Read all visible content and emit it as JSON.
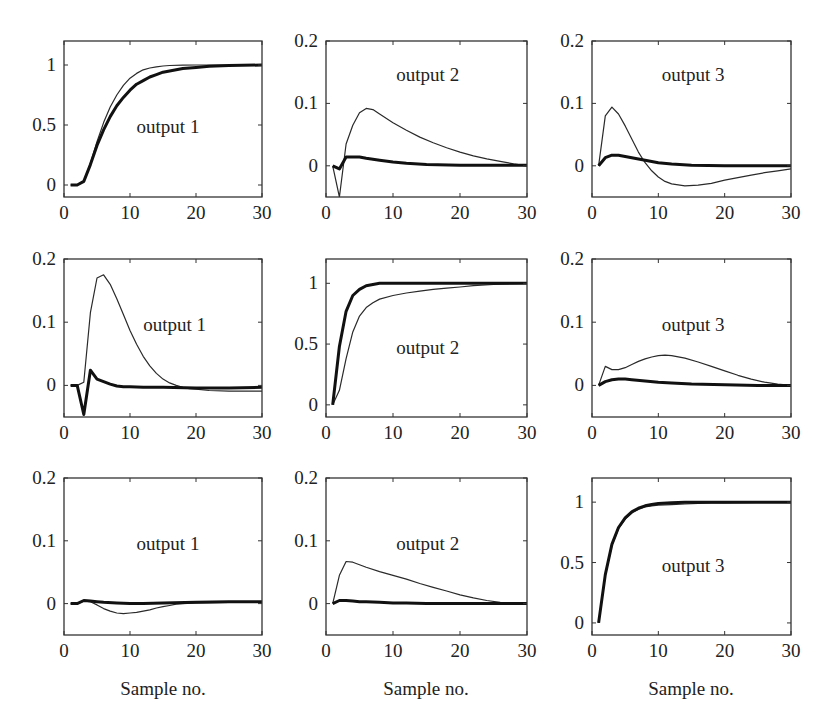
{
  "figure": {
    "xlabel": "Sample no.",
    "line_styles": {
      "thin": {
        "color": "#2a2a2a",
        "width": 1.2
      },
      "thick": {
        "color": "#111111",
        "width": 3
      }
    }
  },
  "chart_data": [
    {
      "type": "line",
      "row": 0,
      "col": 0,
      "title": "output 1",
      "xlabel": "",
      "ylabel": "",
      "xlim": [
        0,
        30
      ],
      "ylim": [
        -0.1,
        1.2
      ],
      "xticks": [
        0,
        10,
        20,
        30
      ],
      "yticks": [
        0,
        0.5,
        1
      ],
      "ytick_labels": [
        "0",
        "0.5",
        "1"
      ],
      "label_pos": [
        11,
        0.48
      ],
      "series": [
        {
          "name": "thin",
          "x": [
            1,
            2,
            3,
            4,
            5,
            6,
            7,
            8,
            9,
            10,
            11,
            12,
            13,
            14,
            15,
            16,
            18,
            20,
            22,
            25,
            30
          ],
          "y": [
            0,
            0,
            0.03,
            0.18,
            0.36,
            0.52,
            0.65,
            0.75,
            0.83,
            0.89,
            0.93,
            0.96,
            0.975,
            0.985,
            0.992,
            0.996,
            0.999,
            1,
            1,
            1,
            1
          ]
        },
        {
          "name": "thick",
          "x": [
            1,
            2,
            3,
            4,
            5,
            6,
            7,
            8,
            9,
            10,
            11,
            12,
            13,
            14,
            15,
            16,
            18,
            20,
            22,
            25,
            30
          ],
          "y": [
            0,
            0,
            0.03,
            0.17,
            0.33,
            0.46,
            0.57,
            0.66,
            0.73,
            0.79,
            0.84,
            0.87,
            0.9,
            0.92,
            0.94,
            0.95,
            0.97,
            0.98,
            0.99,
            0.995,
            1
          ]
        }
      ]
    },
    {
      "type": "line",
      "row": 0,
      "col": 1,
      "title": "output 2",
      "xlabel": "",
      "ylabel": "",
      "xlim": [
        0,
        30
      ],
      "ylim": [
        -0.05,
        0.2
      ],
      "xticks": [
        0,
        10,
        20,
        30
      ],
      "yticks": [
        0,
        0.1,
        0.2
      ],
      "ytick_labels": [
        "0",
        "0.1",
        "0.2"
      ],
      "label_pos": [
        10.5,
        0.145
      ],
      "series": [
        {
          "name": "thin",
          "x": [
            1,
            2,
            3,
            4,
            5,
            6,
            7,
            8,
            10,
            12,
            14,
            16,
            18,
            20,
            22,
            24,
            26,
            28,
            30
          ],
          "y": [
            0,
            -0.05,
            0.035,
            0.065,
            0.085,
            0.092,
            0.09,
            0.083,
            0.069,
            0.057,
            0.046,
            0.037,
            0.029,
            0.022,
            0.016,
            0.011,
            0.007,
            0.003,
            0
          ]
        },
        {
          "name": "thick",
          "x": [
            1,
            2,
            3,
            4,
            5,
            6,
            8,
            10,
            12,
            15,
            20,
            25,
            30
          ],
          "y": [
            0,
            -0.005,
            0.014,
            0.014,
            0.014,
            0.012,
            0.009,
            0.006,
            0.004,
            0.002,
            0.001,
            0.001,
            0.001
          ]
        }
      ]
    },
    {
      "type": "line",
      "row": 0,
      "col": 2,
      "title": "output 3",
      "xlabel": "",
      "ylabel": "",
      "xlim": [
        0,
        30
      ],
      "ylim": [
        -0.05,
        0.2
      ],
      "xticks": [
        0,
        10,
        20,
        30
      ],
      "yticks": [
        0,
        0.1,
        0.2
      ],
      "ytick_labels": [
        "0",
        "0.1",
        "0.2"
      ],
      "label_pos": [
        10.5,
        0.145
      ],
      "series": [
        {
          "name": "thin",
          "x": [
            1,
            2,
            3,
            4,
            5,
            6,
            7,
            8,
            9,
            10,
            11,
            12,
            14,
            16,
            18,
            20,
            22,
            24,
            26,
            28,
            30
          ],
          "y": [
            0,
            0.08,
            0.094,
            0.083,
            0.064,
            0.043,
            0.022,
            0.005,
            -0.008,
            -0.018,
            -0.025,
            -0.029,
            -0.032,
            -0.031,
            -0.028,
            -0.023,
            -0.019,
            -0.015,
            -0.011,
            -0.008,
            -0.005
          ]
        },
        {
          "name": "thick",
          "x": [
            1,
            2,
            3,
            4,
            5,
            6,
            8,
            10,
            12,
            15,
            20,
            25,
            30
          ],
          "y": [
            0,
            0.013,
            0.017,
            0.017,
            0.015,
            0.013,
            0.009,
            0.005,
            0.003,
            0.001,
            0,
            0,
            0
          ]
        }
      ]
    },
    {
      "type": "line",
      "row": 1,
      "col": 0,
      "title": "output 1",
      "xlabel": "",
      "ylabel": "",
      "xlim": [
        0,
        30
      ],
      "ylim": [
        -0.05,
        0.2
      ],
      "xticks": [
        0,
        10,
        20,
        30
      ],
      "yticks": [
        0,
        0.1,
        0.2
      ],
      "ytick_labels": [
        "0",
        "0.1",
        "0.2"
      ],
      "label_pos": [
        12,
        0.095
      ],
      "series": [
        {
          "name": "thin",
          "x": [
            1,
            2,
            3,
            4,
            5,
            6,
            7,
            8,
            9,
            10,
            11,
            12,
            13,
            14,
            15,
            16,
            17,
            18,
            19,
            20,
            22,
            25,
            30
          ],
          "y": [
            0,
            0,
            0.005,
            0.115,
            0.17,
            0.175,
            0.16,
            0.137,
            0.112,
            0.087,
            0.065,
            0.046,
            0.031,
            0.019,
            0.01,
            0.004,
            0,
            -0.003,
            -0.005,
            -0.006,
            -0.008,
            -0.009,
            -0.009
          ]
        },
        {
          "name": "thick",
          "x": [
            1,
            2,
            3,
            4,
            5,
            6,
            7,
            8,
            9,
            10,
            12,
            15,
            20,
            25,
            30
          ],
          "y": [
            0,
            0,
            -0.046,
            0.024,
            0.01,
            0.006,
            0.002,
            -0.001,
            -0.002,
            -0.002,
            -0.003,
            -0.003,
            -0.004,
            -0.004,
            -0.003
          ]
        }
      ]
    },
    {
      "type": "line",
      "row": 1,
      "col": 1,
      "title": "output 2",
      "xlabel": "",
      "ylabel": "",
      "xlim": [
        0,
        30
      ],
      "ylim": [
        -0.1,
        1.2
      ],
      "xticks": [
        0,
        10,
        20,
        30
      ],
      "yticks": [
        0,
        0.5,
        1
      ],
      "ytick_labels": [
        "0",
        "0.5",
        "1"
      ],
      "label_pos": [
        10.5,
        0.47
      ],
      "series": [
        {
          "name": "thin",
          "x": [
            1,
            2,
            3,
            4,
            5,
            6,
            7,
            8,
            10,
            12,
            14,
            16,
            18,
            20,
            22,
            25,
            30
          ],
          "y": [
            0,
            0.12,
            0.38,
            0.6,
            0.73,
            0.8,
            0.84,
            0.87,
            0.9,
            0.92,
            0.935,
            0.95,
            0.96,
            0.97,
            0.98,
            0.99,
            1
          ]
        },
        {
          "name": "thick",
          "x": [
            1,
            2,
            3,
            4,
            5,
            6,
            7,
            8,
            10,
            12,
            15,
            20,
            25,
            30
          ],
          "y": [
            0,
            0.48,
            0.77,
            0.9,
            0.95,
            0.98,
            0.99,
            1,
            1,
            1,
            1,
            1,
            1,
            1
          ]
        }
      ]
    },
    {
      "type": "line",
      "row": 1,
      "col": 2,
      "title": "output 3",
      "xlabel": "",
      "ylabel": "",
      "xlim": [
        0,
        30
      ],
      "ylim": [
        -0.05,
        0.2
      ],
      "xticks": [
        0,
        10,
        20,
        30
      ],
      "yticks": [
        0,
        0.1,
        0.2
      ],
      "ytick_labels": [
        "0",
        "0.1",
        "0.2"
      ],
      "label_pos": [
        10.5,
        0.095
      ],
      "series": [
        {
          "name": "thin",
          "x": [
            1,
            2,
            3,
            4,
            5,
            6,
            7,
            8,
            9,
            10,
            11,
            12,
            14,
            16,
            18,
            20,
            22,
            24,
            26,
            28,
            30
          ],
          "y": [
            0,
            0.03,
            0.025,
            0.025,
            0.028,
            0.033,
            0.038,
            0.042,
            0.045,
            0.047,
            0.048,
            0.047,
            0.043,
            0.037,
            0.03,
            0.023,
            0.016,
            0.01,
            0.005,
            0.002,
            0
          ]
        },
        {
          "name": "thick",
          "x": [
            1,
            2,
            3,
            4,
            5,
            6,
            8,
            10,
            12,
            15,
            20,
            25,
            30
          ],
          "y": [
            0,
            0.006,
            0.009,
            0.01,
            0.01,
            0.009,
            0.007,
            0.005,
            0.004,
            0.002,
            0.001,
            0,
            0
          ]
        }
      ]
    },
    {
      "type": "line",
      "row": 2,
      "col": 0,
      "title": "output 1",
      "xlabel": "Sample no.",
      "ylabel": "",
      "xlim": [
        0,
        30
      ],
      "ylim": [
        -0.05,
        0.2
      ],
      "xticks": [
        0,
        10,
        20,
        30
      ],
      "yticks": [
        0,
        0.1,
        0.2
      ],
      "ytick_labels": [
        "0",
        "0.1",
        "0.2"
      ],
      "label_pos": [
        11,
        0.095
      ],
      "series": [
        {
          "name": "thin",
          "x": [
            1,
            2,
            3,
            4,
            5,
            6,
            7,
            8,
            9,
            10,
            11,
            12,
            13,
            14,
            15,
            16,
            17,
            18,
            20,
            25,
            30
          ],
          "y": [
            0,
            0,
            0.004,
            0.003,
            -0.002,
            -0.008,
            -0.012,
            -0.015,
            -0.016,
            -0.015,
            -0.014,
            -0.012,
            -0.01,
            -0.007,
            -0.005,
            -0.003,
            -0.001,
            0,
            0.001,
            0.002,
            0.002
          ]
        },
        {
          "name": "thick",
          "x": [
            1,
            2,
            3,
            4,
            5,
            6,
            8,
            10,
            12,
            15,
            20,
            25,
            30
          ],
          "y": [
            0,
            0,
            0.005,
            0.004,
            0.003,
            0.002,
            0.001,
            0,
            0,
            0.001,
            0.002,
            0.003,
            0.003
          ]
        }
      ]
    },
    {
      "type": "line",
      "row": 2,
      "col": 1,
      "title": "output 2",
      "xlabel": "Sample no.",
      "ylabel": "",
      "xlim": [
        0,
        30
      ],
      "ylim": [
        -0.05,
        0.2
      ],
      "xticks": [
        0,
        10,
        20,
        30
      ],
      "yticks": [
        0,
        0.1,
        0.2
      ],
      "ytick_labels": [
        "0",
        "0.1",
        "0.2"
      ],
      "label_pos": [
        10.5,
        0.095
      ],
      "series": [
        {
          "name": "thin",
          "x": [
            1,
            2,
            3,
            4,
            5,
            6,
            8,
            10,
            12,
            14,
            16,
            18,
            20,
            22,
            24,
            26,
            28,
            30
          ],
          "y": [
            0,
            0.045,
            0.067,
            0.066,
            0.062,
            0.058,
            0.051,
            0.045,
            0.039,
            0.032,
            0.026,
            0.02,
            0.014,
            0.009,
            0.005,
            0.002,
            0,
            0
          ]
        },
        {
          "name": "thick",
          "x": [
            1,
            2,
            3,
            4,
            5,
            6,
            8,
            10,
            12,
            15,
            20,
            25,
            30
          ],
          "y": [
            0,
            0.005,
            0.005,
            0.004,
            0.003,
            0.003,
            0.002,
            0.001,
            0.001,
            0,
            0,
            0,
            0
          ]
        }
      ]
    },
    {
      "type": "line",
      "row": 2,
      "col": 2,
      "title": "output 3",
      "xlabel": "Sample no.",
      "ylabel": "",
      "xlim": [
        0,
        30
      ],
      "ylim": [
        -0.1,
        1.2
      ],
      "xticks": [
        0,
        10,
        20,
        30
      ],
      "yticks": [
        0,
        0.5,
        1
      ],
      "ytick_labels": [
        "0",
        "0.5",
        "1"
      ],
      "label_pos": [
        10.5,
        0.47
      ],
      "series": [
        {
          "name": "thin",
          "x": [
            1,
            2,
            3,
            4,
            5,
            6,
            7,
            8,
            9,
            10,
            12,
            14,
            16,
            18,
            20,
            25,
            30
          ],
          "y": [
            0,
            0.39,
            0.64,
            0.78,
            0.86,
            0.91,
            0.94,
            0.96,
            0.97,
            0.975,
            0.98,
            0.985,
            0.99,
            0.993,
            0.995,
            0.998,
            1
          ]
        },
        {
          "name": "thick",
          "x": [
            1,
            2,
            3,
            4,
            5,
            6,
            7,
            8,
            9,
            10,
            12,
            14,
            16,
            18,
            20,
            25,
            30
          ],
          "y": [
            0,
            0.4,
            0.65,
            0.79,
            0.87,
            0.92,
            0.95,
            0.97,
            0.98,
            0.99,
            0.995,
            1,
            1,
            1,
            1,
            1,
            1
          ]
        }
      ]
    }
  ]
}
